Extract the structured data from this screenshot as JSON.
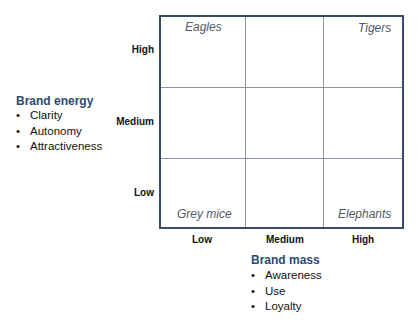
{
  "y_axis": {
    "heading": "Brand energy",
    "items": [
      "Clarity",
      "Autonomy",
      "Attractiveness"
    ],
    "ticks": [
      "High",
      "Medium",
      "Low"
    ]
  },
  "x_axis": {
    "heading": "Brand mass",
    "items": [
      "Awareness",
      "Use",
      "Loyalty"
    ],
    "ticks": [
      "Low",
      "Medium",
      "High"
    ]
  },
  "quadrants": {
    "top_left": "Eagles",
    "top_right": "Tigers",
    "bottom_left": "Grey mice",
    "bottom_right": "Elephants"
  },
  "colors": {
    "heading": "#2e4a72",
    "grid_border": "#3b4a63",
    "grid_inner": "#8a94a8",
    "quadrant_label": "#505a6b"
  }
}
